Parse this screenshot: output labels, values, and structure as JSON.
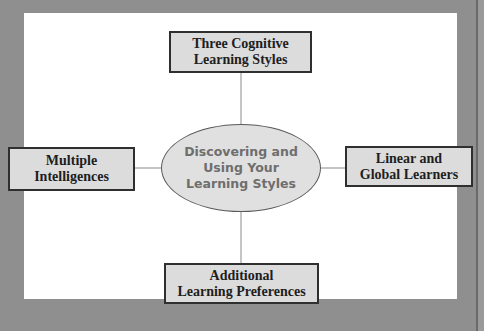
{
  "diagram": {
    "type": "hub-and-spoke concept map",
    "center": {
      "lines": [
        "Discovering and",
        "Using Your",
        "Learning Styles"
      ]
    },
    "nodes": {
      "top": {
        "lines": [
          "Three Cognitive",
          "Learning Styles"
        ]
      },
      "left": {
        "lines": [
          "Multiple",
          "Intelligences"
        ]
      },
      "right": {
        "lines": [
          "Linear and",
          "Global Learners"
        ]
      },
      "bottom": {
        "lines": [
          "Additional",
          "Learning Preferences"
        ]
      }
    },
    "colors": {
      "background": "#8f8f8f",
      "panel": "#ffffff",
      "box_fill": "#dcdcdc",
      "box_border": "#2f2f2f",
      "ellipse_fill": "#e0e0e0",
      "ellipse_text": "#6e6e6e",
      "connector": "#8a8a8a"
    }
  }
}
